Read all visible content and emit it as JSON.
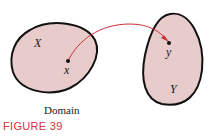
{
  "figure": {
    "caption": "FIGURE 39",
    "caption_color": "#d2343a",
    "set_fill": "#e8cccb",
    "arrow_color": "#c8323a",
    "left_set": {
      "name": "X",
      "point": "x",
      "caption": "Domain"
    },
    "right_set": {
      "name": "Y",
      "point": "y"
    }
  }
}
